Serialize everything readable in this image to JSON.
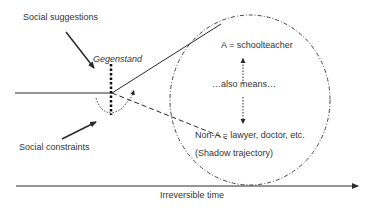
{
  "diagram": {
    "labels": {
      "social_suggestions": "Social suggestions",
      "gegenstand": "Gegenstand",
      "a_equals": "A = schoolteacher",
      "also_means": "…also means…",
      "non_a": "Non-A = lawyer, doctor, etc.",
      "shadow": "(Shadow trajectory)",
      "social_constraints": "Social constraints",
      "time_axis": "Irreversible time"
    },
    "colors": {
      "line": "#2a2a2a",
      "background": "#ffffff"
    }
  }
}
